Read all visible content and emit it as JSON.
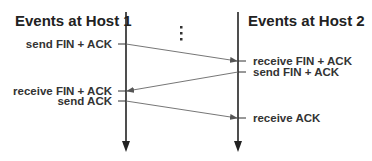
{
  "diagram": {
    "host1": {
      "title": "Events at Host 1"
    },
    "host2": {
      "title": "Events at Host 2"
    },
    "ellipsis": "⋮",
    "host1_events": [
      {
        "label": "send FIN + ACK"
      },
      {
        "label": "receive FIN + ACK"
      },
      {
        "label": "send ACK"
      }
    ],
    "host2_events": [
      {
        "label": "receive FIN + ACK"
      },
      {
        "label": "send FIN + ACK"
      },
      {
        "label": "receive ACK"
      }
    ],
    "colors": {
      "timeline": "#222222",
      "message": "#555555",
      "text": "#333333"
    }
  }
}
